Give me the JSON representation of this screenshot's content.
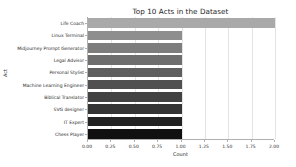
{
  "chart_data": {
    "type": "bar",
    "orientation": "horizontal",
    "title": "Top 10 Acts in the Dataset",
    "xlabel": "Count",
    "ylabel": "Act",
    "categories": [
      "Life Coach",
      "Linux Terminal",
      "Midjourney Prompt Generator",
      "Legal Advisor",
      "Personal Stylist",
      "Machine Learning Engineer",
      "Biblical Translator",
      "SVG designer",
      "IT Expert",
      "Chess Player"
    ],
    "values": [
      2.0,
      1.0,
      1.0,
      1.0,
      1.0,
      1.0,
      1.0,
      1.0,
      1.0,
      1.0
    ],
    "xlim": [
      0.0,
      2.0
    ],
    "xticks": [
      "0.00",
      "0.25",
      "0.50",
      "0.75",
      "1.00",
      "1.25",
      "1.50",
      "1.75",
      "2.00"
    ],
    "xtick_values": [
      0.0,
      0.25,
      0.5,
      0.75,
      1.0,
      1.25,
      1.5,
      1.75,
      2.0
    ],
    "grid": true,
    "grid_axis": "x",
    "legend": null,
    "bar_colors": [
      "#a9a9a9",
      "#8e8e8e",
      "#7d7d7d",
      "#6e6e6e",
      "#5f5f5f",
      "#505050",
      "#424242",
      "#343434",
      "#222222",
      "#101010"
    ],
    "grid_color": "#e4e4e4",
    "axis_color": "#b0b0b0",
    "text_color": "#262626",
    "background": "#ffffff"
  }
}
